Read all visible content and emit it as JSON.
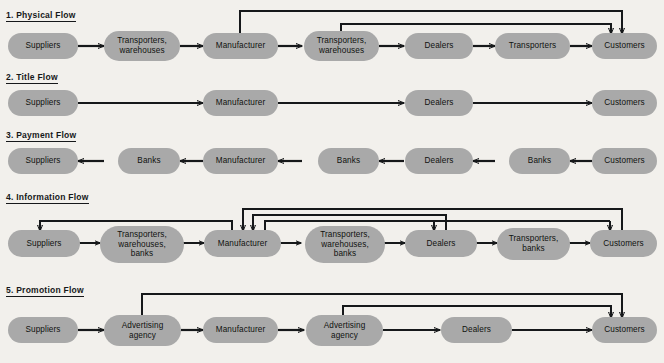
{
  "diagram": {
    "title_visible": false,
    "background_color": "#f2f0ec",
    "node_color": "#a9a9a9",
    "line_color": "#16181a",
    "rows": [
      {
        "id": "physical-flow",
        "number": "1.",
        "label": "1.  Physical Flow",
        "name": "Physical Flow",
        "nodes": [
          {
            "id": "r1-suppliers",
            "label": "Suppliers"
          },
          {
            "id": "r1-transporters-warehouses-1",
            "label": "Transporters,\nwarehouses"
          },
          {
            "id": "r1-manufacturer",
            "label": "Manufacturer"
          },
          {
            "id": "r1-transporters-warehouses-2",
            "label": "Transporters,\nwarehouses"
          },
          {
            "id": "r1-dealers",
            "label": "Dealers"
          },
          {
            "id": "r1-transporters",
            "label": "Transporters"
          },
          {
            "id": "r1-customers",
            "label": "Customers"
          }
        ],
        "connector_direction": "forward",
        "feedback_lines": 2
      },
      {
        "id": "title-flow",
        "number": "2.",
        "label": "2.  Title Flow",
        "name": "Title Flow",
        "nodes": [
          {
            "id": "r2-suppliers",
            "label": "Suppliers"
          },
          {
            "id": "r2-manufacturer",
            "label": "Manufacturer"
          },
          {
            "id": "r2-dealers",
            "label": "Dealers"
          },
          {
            "id": "r2-customers",
            "label": "Customers"
          }
        ],
        "connector_direction": "forward",
        "feedback_lines": 0
      },
      {
        "id": "payment-flow",
        "number": "3.",
        "label": "3.  Payment Flow",
        "name": "Payment Flow",
        "nodes": [
          {
            "id": "r3-suppliers",
            "label": "Suppliers"
          },
          {
            "id": "r3-banks-1",
            "label": "Banks"
          },
          {
            "id": "r3-manufacturer",
            "label": "Manufacturer"
          },
          {
            "id": "r3-banks-2",
            "label": "Banks"
          },
          {
            "id": "r3-dealers",
            "label": "Dealers"
          },
          {
            "id": "r3-banks-3",
            "label": "Banks"
          },
          {
            "id": "r3-customers",
            "label": "Customers"
          }
        ],
        "connector_direction": "backward",
        "feedback_lines": 0
      },
      {
        "id": "information-flow",
        "number": "4.",
        "label": "4.  Information Flow",
        "name": "Information Flow",
        "nodes": [
          {
            "id": "r4-suppliers",
            "label": "Suppliers"
          },
          {
            "id": "r4-transporters-warehouses-banks-1",
            "label": "Transporters,\nwarehouses,\nbanks"
          },
          {
            "id": "r4-manufacturer",
            "label": "Manufacturer"
          },
          {
            "id": "r4-transporters-warehouses-banks-2",
            "label": "Transporters,\nwarehouses,\nbanks"
          },
          {
            "id": "r4-dealers",
            "label": "Dealers"
          },
          {
            "id": "r4-transporters-banks",
            "label": "Transporters,\nbanks"
          },
          {
            "id": "r4-customers",
            "label": "Customers"
          }
        ],
        "connector_direction": "bidirectional",
        "feedback_lines": 4
      },
      {
        "id": "promotion-flow",
        "number": "5.",
        "label": "5.  Promotion Flow",
        "name": "Promotion Flow",
        "nodes": [
          {
            "id": "r5-suppliers",
            "label": "Suppliers"
          },
          {
            "id": "r5-advertising-agency-1",
            "label": "Advertising\nagency"
          },
          {
            "id": "r5-manufacturer",
            "label": "Manufacturer"
          },
          {
            "id": "r5-advertising-agency-2",
            "label": "Advertising\nagency"
          },
          {
            "id": "r5-dealers",
            "label": "Dealers"
          },
          {
            "id": "r5-customers",
            "label": "Customers"
          }
        ],
        "connector_direction": "forward",
        "feedback_lines": 2
      }
    ]
  }
}
